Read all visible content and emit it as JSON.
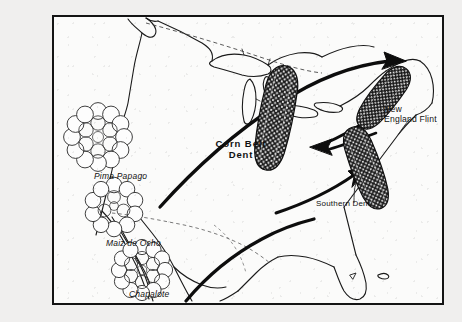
{
  "figure": {
    "type": "diagram-map",
    "background_color": "#f0efee",
    "map_fill_color": "#fbfbfa",
    "ink_color": "#141414",
    "frame": {
      "border_color": "#141414",
      "border_width_px": 2
    }
  },
  "labels": {
    "pima_papago": "Pima Papago",
    "maiz_de_ocho": "Maiz de Ocho",
    "chapalote": "Chapalote",
    "corn_belt_dent_line1": "Corn Belt",
    "corn_belt_dent_line2": "Dent",
    "new_england_flint_line1": "New",
    "new_england_flint_line2": "England Flint",
    "southern_dent": "Southern Dent"
  },
  "kernel_rosettes": [
    {
      "name": "pima-papago-rosette",
      "label": "Pima Papago",
      "cx": 96,
      "cy": 135,
      "r": 27,
      "kernels": 12
    },
    {
      "name": "maiz-de-ocho-rosette",
      "label": "Maiz de Ocho",
      "cx": 112,
      "cy": 205,
      "r": 23,
      "kernels": 10
    },
    {
      "name": "chapalote-rosette",
      "label": "Chapalote",
      "cx": 140,
      "cy": 268,
      "r": 24,
      "kernels": 13
    }
  ],
  "corn_cobs": [
    {
      "name": "corn-belt-dent-cob",
      "label": "Corn Belt Dent",
      "x": 270,
      "y": 95,
      "w": 30,
      "h": 105,
      "angle": 12
    },
    {
      "name": "new-england-flint-cob",
      "label": "New England Flint",
      "x": 378,
      "y": 52,
      "w": 24,
      "h": 72,
      "angle": 38
    },
    {
      "name": "southern-dent-cob",
      "label": "Southern Dent",
      "x": 352,
      "y": 130,
      "w": 26,
      "h": 82,
      "angle": -22
    }
  ],
  "arrows": [
    {
      "name": "arrow-southwest-to-new-england",
      "from": "Maiz de Ocho",
      "to": "New England Flint"
    },
    {
      "name": "arrow-southern-to-corn-belt",
      "from": "Southern Dent",
      "to": "Corn Belt Dent"
    },
    {
      "name": "arrow-gulf-to-southern-dent",
      "from": "Gulf Coast",
      "to": "Southern Dent"
    },
    {
      "name": "arrow-mexico-north",
      "from": "Mexico",
      "to": "Gulf Coast"
    }
  ],
  "map_features": {
    "border_dashed_label": "US-Canada border",
    "coastlines": "North America outline with Great Lakes, Baja California, Florida"
  }
}
